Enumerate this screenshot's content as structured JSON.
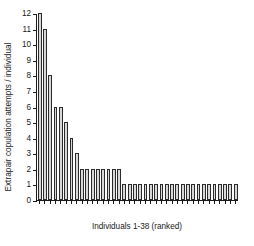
{
  "chart_data": {
    "type": "bar",
    "title": "",
    "xlabel": "Individuals 1-38 (ranked)",
    "ylabel": "Extrapair copulation attempts / individual",
    "categories": [
      "1",
      "2",
      "3",
      "4",
      "5",
      "6",
      "7",
      "8",
      "9",
      "10",
      "11",
      "12",
      "13",
      "14",
      "15",
      "16",
      "17",
      "18",
      "19",
      "20",
      "21",
      "22",
      "23",
      "24",
      "25",
      "26",
      "27",
      "28",
      "29",
      "30",
      "31",
      "32",
      "33",
      "34",
      "35",
      "36",
      "37",
      "38"
    ],
    "values": [
      12,
      11,
      8,
      6,
      6,
      5,
      4,
      3,
      2,
      2,
      2,
      2,
      2,
      2,
      2,
      2,
      1,
      1,
      1,
      1,
      1,
      1,
      1,
      1,
      1,
      1,
      1,
      1,
      1,
      1,
      1,
      1,
      1,
      1,
      1,
      1,
      1,
      1
    ],
    "ylim": [
      0,
      12
    ],
    "yticks": [
      0,
      1,
      2,
      3,
      4,
      5,
      6,
      7,
      8,
      9,
      10,
      11,
      12
    ],
    "ytick_labels": [
      "0",
      "1",
      "2",
      "3",
      "4",
      "5",
      "6",
      "7",
      "8",
      "9",
      "10",
      "11",
      "12"
    ],
    "grid": false,
    "legend": null,
    "bar_fill": "#d8d8d8",
    "bar_edge": "#2b2b2b",
    "axis_color": "#1a1a1a"
  }
}
